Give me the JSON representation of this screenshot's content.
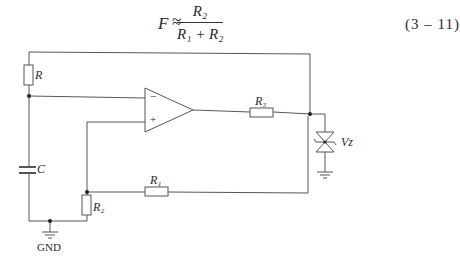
{
  "formula": {
    "lhs": "F",
    "relation": "≈",
    "numerator": "R₂",
    "denominator": "R₁ + R₂",
    "equation_number": "(3 – 11)"
  },
  "circuit": {
    "components": [
      {
        "id": "R",
        "type": "resistor",
        "label": "R"
      },
      {
        "id": "C",
        "type": "capacitor",
        "label": "C"
      },
      {
        "id": "R1",
        "type": "resistor",
        "label": "R₁"
      },
      {
        "id": "R2",
        "type": "resistor",
        "label": "R₂"
      },
      {
        "id": "R3",
        "type": "resistor",
        "label": "R₃"
      },
      {
        "id": "U1",
        "type": "op-amp",
        "inverting_label": "−",
        "noninverting_label": "+"
      },
      {
        "id": "Vz",
        "type": "bidirectional-zener",
        "label": "Vz"
      }
    ],
    "ground_label": "GND",
    "labels": {
      "r": "R",
      "c": "C",
      "r1": "R₁",
      "r2": "R₂",
      "r3": "R₃",
      "vz": "Vz",
      "minus": "−",
      "plus": "+",
      "gnd": "GND"
    }
  },
  "colors": {
    "line": "#555555",
    "text": "#2a2a2a"
  }
}
